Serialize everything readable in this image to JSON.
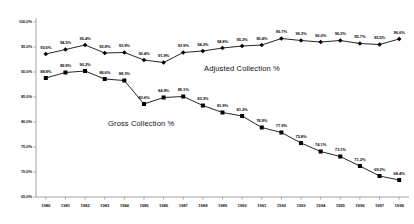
{
  "chart_data": {
    "type": "line",
    "title": "",
    "xlabel": "",
    "ylabel": "",
    "grid": false,
    "legend_position": "inline-annotations",
    "ylim": [
      65.0,
      100.0
    ],
    "ytick_labels": [
      "100.0%",
      "95.0%",
      "90.0%",
      "85.0%",
      "80.0%",
      "75.0%",
      "70.0%",
      "65.0%"
    ],
    "ytick_values": [
      100.0,
      95.0,
      90.0,
      85.0,
      80.0,
      75.0,
      70.0,
      65.0
    ],
    "categories": [
      "1980",
      "1981",
      "1982",
      "1983",
      "1984",
      "1985",
      "1986",
      "1987",
      "1988",
      "1989",
      "1990",
      "1991",
      "1992",
      "1993",
      "1994",
      "1995",
      "1996",
      "1997",
      "1998"
    ],
    "series": [
      {
        "name": "Adjusted Collection %",
        "marker": "diamond",
        "color": "#000000",
        "values": [
          93.6,
          94.5,
          95.4,
          93.8,
          93.9,
          92.4,
          91.9,
          93.9,
          94.2,
          94.8,
          95.2,
          95.4,
          96.7,
          96.3,
          96.0,
          96.3,
          95.7,
          95.5,
          96.6
        ],
        "labels": [
          "93.6%",
          "94.5%",
          "95.4%",
          "93.8%",
          "93.9%",
          "92.4%",
          "91.9%",
          "93.9%",
          "94.2%",
          "94.8%",
          "95.2%",
          "95.4%",
          "96.7%",
          "96.3%",
          "96.0%",
          "96.3%",
          "95.7%",
          "95.5%",
          "96.6%"
        ]
      },
      {
        "name": "Gross Collection %",
        "marker": "square",
        "color": "#000000",
        "values": [
          88.8,
          89.9,
          90.2,
          88.6,
          88.3,
          83.6,
          84.9,
          85.1,
          83.3,
          81.9,
          81.2,
          78.9,
          77.9,
          75.8,
          74.1,
          73.1,
          71.2,
          69.2,
          68.4
        ],
        "labels": [
          "88.8%",
          "89.9%",
          "90.2%",
          "88.6%",
          "88.3%",
          "83.6%",
          "84.9%",
          "85.1%",
          "83.3%",
          "81.9%",
          "81.2%",
          "78.9%",
          "77.9%",
          "75.8%",
          "74.1%",
          "73.1%",
          "71.2%",
          "69.2%",
          "68.4%"
        ]
      }
    ],
    "annotations": [
      {
        "text": "Adjusted Collection %",
        "x_px": 204,
        "y_px": 64
      },
      {
        "text": "Gross Collection %",
        "x_px": 108,
        "y_px": 119
      }
    ]
  }
}
